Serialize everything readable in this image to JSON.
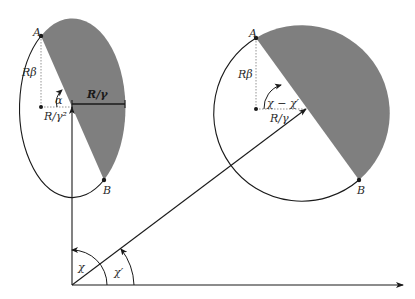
{
  "colors": {
    "shade": "#7f7f7f",
    "stroke": "#1a1a1a",
    "dotted": "#888888",
    "background": "#ffffff"
  },
  "left_figure": {
    "point_a": "A",
    "point_b": "B",
    "height_label": "Rβ",
    "angle_label": "α",
    "center_offset_label": "R/γ²",
    "half_width_label": "R/γ"
  },
  "right_figure": {
    "point_a": "A",
    "point_b": "B",
    "height_label": "Rβ",
    "angle_label": "χ − χ′",
    "radius_label": "R/γ"
  },
  "origin_angles": {
    "chi": "χ",
    "chi_prime": "χ′"
  }
}
